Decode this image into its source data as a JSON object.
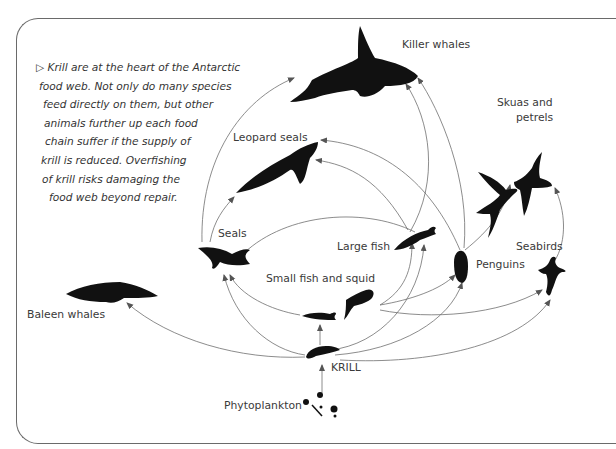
{
  "caption": {
    "marker": "▷",
    "lines": [
      "Krill are at the heart of the Antarctic",
      "food web. Not only do many species",
      "feed directly on them, but other",
      "animals further up each food",
      "chain suffer if the supply of",
      "krill is reduced. Overfishing",
      "of krill risks damaging the",
      "food web beyond repair."
    ]
  },
  "nodes": {
    "killer_whales": "Killer whales",
    "skuas_petrels_1": "Skuas and",
    "skuas_petrels_2": "petrels",
    "leopard_seals": "Leopard seals",
    "seals": "Seals",
    "large_fish": "Large fish",
    "seabirds": "Seabirds",
    "penguins": "Penguins",
    "small_fish_squid": "Small fish and squid",
    "baleen_whales": "Baleen whales",
    "krill": "KRILL",
    "phytoplankton": "Phytoplankton"
  },
  "colors": {
    "frame": "#6a6a6a",
    "arrow": "#6f6f6f",
    "silhouette": "#111111",
    "text": "#3a3a3a"
  }
}
